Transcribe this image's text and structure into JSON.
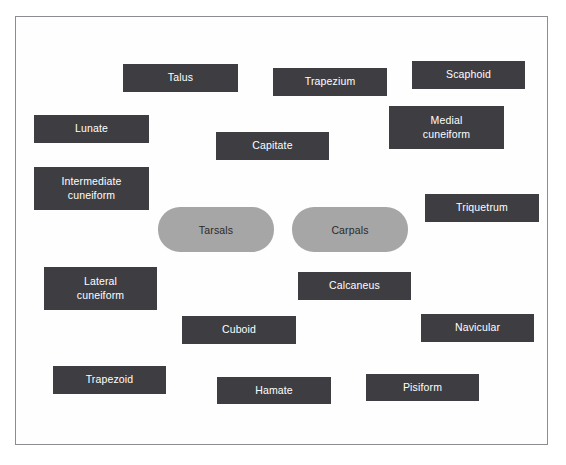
{
  "activity": {
    "frame": {
      "x": 15,
      "y": 16,
      "width": 533,
      "height": 429
    },
    "background_color": "#fefefe",
    "border_color": "#8d8d91",
    "tile_color": "#3e3e42",
    "tile_text_color": "#ffffff",
    "category_color": "#a6a6a6",
    "category_text_color": "#2a2a2a"
  },
  "categories": [
    {
      "label": "Tarsals",
      "x": 157,
      "y": 206,
      "width": 116,
      "height": 45
    },
    {
      "label": "Carpals",
      "x": 291,
      "y": 206,
      "width": 116,
      "height": 45
    }
  ],
  "tiles": [
    {
      "label": "Talus",
      "x": 122,
      "y": 63,
      "width": 115,
      "height": 28
    },
    {
      "label": "Trapezium",
      "x": 272,
      "y": 67,
      "width": 114,
      "height": 28
    },
    {
      "label": "Scaphoid",
      "x": 411,
      "y": 60,
      "width": 113,
      "height": 28
    },
    {
      "label": "Lunate",
      "x": 33,
      "y": 114,
      "width": 115,
      "height": 28
    },
    {
      "label": "Medial\ncuneiform",
      "x": 388,
      "y": 105,
      "width": 115,
      "height": 43
    },
    {
      "label": "Capitate",
      "x": 215,
      "y": 131,
      "width": 113,
      "height": 28
    },
    {
      "label": "Intermediate\ncuneiform",
      "x": 33,
      "y": 166,
      "width": 115,
      "height": 43
    },
    {
      "label": "Triquetrum",
      "x": 424,
      "y": 193,
      "width": 114,
      "height": 28
    },
    {
      "label": "Lateral\ncuneiform",
      "x": 43,
      "y": 266,
      "width": 113,
      "height": 43
    },
    {
      "label": "Calcaneus",
      "x": 297,
      "y": 271,
      "width": 113,
      "height": 28
    },
    {
      "label": "Cuboid",
      "x": 181,
      "y": 315,
      "width": 114,
      "height": 28
    },
    {
      "label": "Navicular",
      "x": 420,
      "y": 313,
      "width": 113,
      "height": 28
    },
    {
      "label": "Trapezoid",
      "x": 52,
      "y": 365,
      "width": 113,
      "height": 28
    },
    {
      "label": "Hamate",
      "x": 216,
      "y": 376,
      "width": 114,
      "height": 27
    },
    {
      "label": "Pisiform",
      "x": 365,
      "y": 373,
      "width": 113,
      "height": 27
    }
  ]
}
